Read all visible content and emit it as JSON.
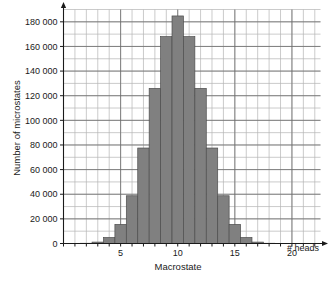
{
  "figure": {
    "top_caption": "",
    "background": "#ffffff",
    "bar_fill": "#808080",
    "bar_stroke": "#4d4d4d",
    "grid_minor_color": "#b5b5b5",
    "grid_major_color": "#6b6b6b",
    "axis_color": "#1a1a1a"
  },
  "chart_data": {
    "type": "bar",
    "title": "",
    "subtitle": "",
    "xlabel": "Macrostate",
    "ylabel": "Number of microstates",
    "x_axis_annotation": "# heads",
    "categories": [
      0,
      1,
      2,
      3,
      4,
      5,
      6,
      7,
      8,
      9,
      10,
      11,
      12,
      13,
      14,
      15,
      16,
      17,
      18,
      19,
      20
    ],
    "values": [
      1,
      20,
      190,
      1140,
      4845,
      15504,
      38760,
      77520,
      125970,
      167960,
      184756,
      167960,
      125970,
      77520,
      38760,
      15504,
      4845,
      1140,
      190,
      20,
      1
    ],
    "xtick_labels": [
      "5",
      "10",
      "15",
      "20"
    ],
    "xtick_values": [
      5,
      10,
      15,
      20
    ],
    "ytick_labels": [
      "0",
      "20 000",
      "40 000",
      "60 000",
      "80 000",
      "100 000",
      "120 000",
      "140 000",
      "160 000",
      "180 000"
    ],
    "ytick_values": [
      0,
      20000,
      40000,
      60000,
      80000,
      100000,
      120000,
      140000,
      160000,
      180000
    ],
    "xlim": [
      0,
      22.5
    ],
    "ylim": [
      0,
      190000
    ],
    "grid": true,
    "legend": "none",
    "legend_position": "none"
  }
}
